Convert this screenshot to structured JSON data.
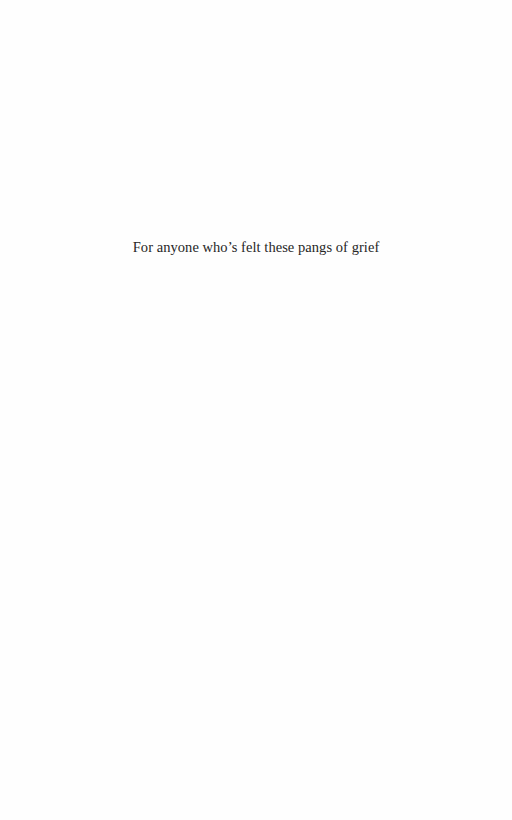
{
  "page": {
    "type": "dedication",
    "background_color": "#ffffff",
    "text_color": "#262626"
  },
  "dedication": {
    "text": "For anyone who’s felt these pangs of grief"
  }
}
